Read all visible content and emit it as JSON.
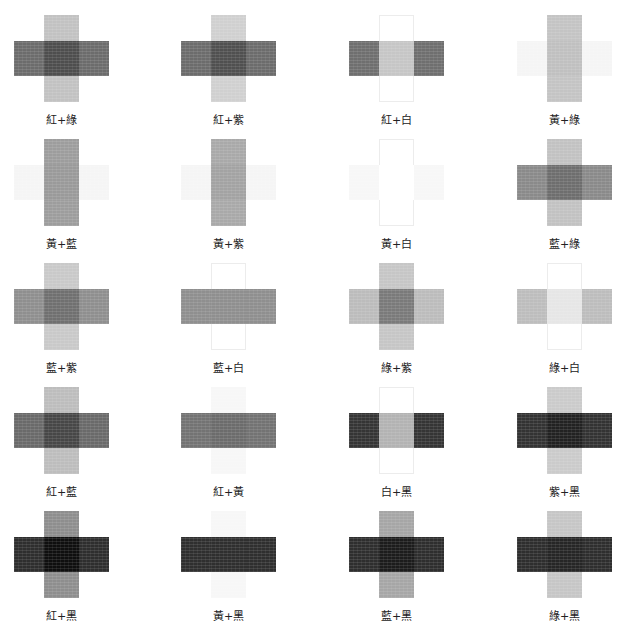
{
  "page": {
    "title_caption_partial": "（上方文字被裁切，不可辨識）"
  },
  "legend": {
    "colors": {
      "紅": "#6f6f6f",
      "黃": "#f4f4f4",
      "藍": "#8a8a8a",
      "綠": "#bdbdbd",
      "紫": "#cfcfcf",
      "白": "#ffffff",
      "黑": "#2a2a2a"
    }
  },
  "swatches": [
    {
      "label": "紅+綠",
      "h": "#6c6c6c",
      "v": "#c2c2c2",
      "overlap": "#4e4e4e",
      "v_outline": false
    },
    {
      "label": "紅+紫",
      "h": "#6c6c6c",
      "v": "#d0d0d0",
      "overlap": "#505050",
      "v_outline": false
    },
    {
      "label": "紅+白",
      "h": "#6f6f6f",
      "v": "#ffffff",
      "overlap": "#c6c6c6",
      "v_outline": true
    },
    {
      "label": "黃+綠",
      "h": "#f5f5f5",
      "v": "#c4c4c4",
      "overlap": "#c0c0c0",
      "v_outline": false
    },
    {
      "label": "黃+藍",
      "h": "#f5f5f5",
      "v": "#9d9d9d",
      "overlap": "#9a9a9a",
      "v_outline": false
    },
    {
      "label": "黃+紫",
      "h": "#f5f5f5",
      "v": "#a9a9a9",
      "overlap": "#a3a3a3",
      "v_outline": false
    },
    {
      "label": "黃+白",
      "h": "#f7f7f7",
      "v": "#ffffff",
      "overlap": "#ffffff",
      "v_outline": true
    },
    {
      "label": "藍+綠",
      "h": "#8a8a8a",
      "v": "#c2c2c2",
      "overlap": "#6e6e6e",
      "v_outline": false
    },
    {
      "label": "藍+紫",
      "h": "#8f8f8f",
      "v": "#c9c9c9",
      "overlap": "#707070",
      "v_outline": false
    },
    {
      "label": "藍+白",
      "h": "#8f8f8f",
      "v": "#ffffff",
      "overlap": "#8f8f8f",
      "v_outline": true
    },
    {
      "label": "綠+紫",
      "h": "#bcbcbc",
      "v": "#c6c6c6",
      "overlap": "#7a7a7a",
      "v_outline": false
    },
    {
      "label": "綠+白",
      "h": "#bdbdbd",
      "v": "#ffffff",
      "overlap": "#e6e6e6",
      "v_outline": true
    },
    {
      "label": "紅+藍",
      "h": "#6a6a6a",
      "v": "#bdbdbd",
      "overlap": "#474747",
      "v_outline": false
    },
    {
      "label": "紅+黃",
      "h": "#737373",
      "v": "#f7f7f7",
      "overlap": "#6c6c6c",
      "v_outline": false
    },
    {
      "label": "白+黑",
      "h": "#353535",
      "v": "#ffffff",
      "overlap": "#b3b3b3",
      "v_outline": true
    },
    {
      "label": "紫+黑",
      "h": "#333333",
      "v": "#cbcbcb",
      "overlap": "#222222",
      "v_outline": false
    },
    {
      "label": "紅+黑",
      "h": "#2e2e2e",
      "v": "#8e8e8e",
      "overlap": "#0f0f0f",
      "v_outline": false
    },
    {
      "label": "黃+黑",
      "h": "#2f2f2f",
      "v": "#f7f7f7",
      "overlap": "#2f2f2f",
      "v_outline": false
    },
    {
      "label": "藍+黑",
      "h": "#2e2e2e",
      "v": "#a6a6a6",
      "overlap": "#1c1c1c",
      "v_outline": false
    },
    {
      "label": "綠+黑",
      "h": "#2e2e2e",
      "v": "#c6c6c6",
      "overlap": "#262626",
      "v_outline": false
    }
  ]
}
